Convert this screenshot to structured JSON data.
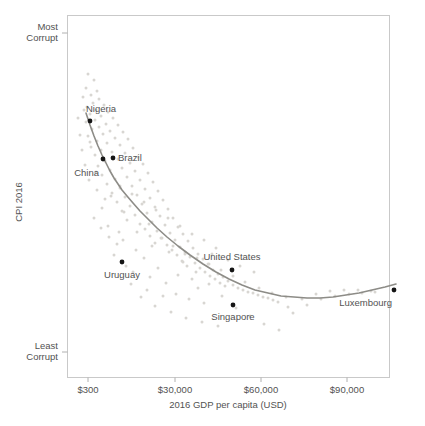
{
  "chart_data": {
    "type": "scatter",
    "title": "",
    "subtitle": "",
    "xlabel": "2016 GDP per capita (USD)",
    "ylabel": "CPI 2016",
    "grid": false,
    "legend": "none",
    "x_scale": "log",
    "x_ticks": [
      {
        "label": "$300",
        "px": 88
      },
      {
        "label": "$30,000",
        "px": 175
      },
      {
        "label": "$60,000",
        "px": 261
      },
      {
        "label": "$90,000",
        "px": 347
      }
    ],
    "y_ticks": [
      {
        "label_line1": "Most",
        "label_line2": "Corrupt",
        "px": 33
      },
      {
        "label_line1": "Least",
        "label_line2": "Corrupt",
        "px": 352
      }
    ],
    "y_axis_direction": "most-corrupt-at-top",
    "highlighted_points": [
      {
        "name": "Nigeria",
        "px": 90,
        "py": 121,
        "label_px": 86,
        "label_py": 112,
        "anchor": "start"
      },
      {
        "name": "China",
        "px": 103,
        "py": 159,
        "label_px": 99,
        "label_py": 176,
        "anchor": "end"
      },
      {
        "name": "Brazil",
        "px": 113,
        "py": 158,
        "label_px": 118,
        "label_py": 161,
        "anchor": "start"
      },
      {
        "name": "Uruguay",
        "px": 122,
        "py": 262,
        "label_px": 122,
        "label_py": 278,
        "anchor": "middle"
      },
      {
        "name": "United States",
        "px": 232,
        "py": 270,
        "label_px": 232,
        "label_py": 260,
        "anchor": "middle"
      },
      {
        "name": "Singapore",
        "px": 233,
        "py": 305,
        "label_px": 233,
        "label_py": 320,
        "anchor": "middle"
      },
      {
        "name": "Luxembourg",
        "px": 394,
        "py": 290,
        "label_px": 392,
        "label_py": 306,
        "anchor": "end"
      }
    ],
    "background_points": [
      [
        88,
        74
      ],
      [
        94,
        80
      ],
      [
        86,
        88
      ],
      [
        97,
        91
      ],
      [
        91,
        95
      ],
      [
        83,
        97
      ],
      [
        99,
        99
      ],
      [
        93,
        103
      ],
      [
        104,
        105
      ],
      [
        87,
        107
      ],
      [
        96,
        110
      ],
      [
        108,
        112
      ],
      [
        90,
        114
      ],
      [
        101,
        116
      ],
      [
        113,
        118
      ],
      [
        95,
        120
      ],
      [
        86,
        122
      ],
      [
        106,
        124
      ],
      [
        118,
        125
      ],
      [
        99,
        127
      ],
      [
        92,
        129
      ],
      [
        110,
        131
      ],
      [
        123,
        132
      ],
      [
        103,
        134
      ],
      [
        88,
        136
      ],
      [
        115,
        138
      ],
      [
        128,
        139
      ],
      [
        97,
        141
      ],
      [
        107,
        143
      ],
      [
        120,
        145
      ],
      [
        91,
        147
      ],
      [
        133,
        148
      ],
      [
        101,
        150
      ],
      [
        112,
        152
      ],
      [
        125,
        153
      ],
      [
        95,
        155
      ],
      [
        138,
        157
      ],
      [
        118,
        159
      ],
      [
        105,
        161
      ],
      [
        130,
        163
      ],
      [
        143,
        164
      ],
      [
        98,
        166
      ],
      [
        122,
        168
      ],
      [
        110,
        170
      ],
      [
        135,
        171
      ],
      [
        148,
        173
      ],
      [
        102,
        175
      ],
      [
        127,
        177
      ],
      [
        115,
        179
      ],
      [
        140,
        180
      ],
      [
        153,
        182
      ],
      [
        107,
        184
      ],
      [
        132,
        186
      ],
      [
        120,
        188
      ],
      [
        145,
        189
      ],
      [
        158,
        191
      ],
      [
        112,
        193
      ],
      [
        137,
        195
      ],
      [
        125,
        197
      ],
      [
        150,
        198
      ],
      [
        163,
        200
      ],
      [
        117,
        202
      ],
      [
        142,
        204
      ],
      [
        130,
        206
      ],
      [
        155,
        207
      ],
      [
        168,
        209
      ],
      [
        122,
        211
      ],
      [
        147,
        213
      ],
      [
        135,
        215
      ],
      [
        160,
        216
      ],
      [
        173,
        218
      ],
      [
        127,
        220
      ],
      [
        152,
        222
      ],
      [
        140,
        224
      ],
      [
        165,
        225
      ],
      [
        178,
        227
      ],
      [
        145,
        229
      ],
      [
        157,
        231
      ],
      [
        170,
        233
      ],
      [
        183,
        234
      ],
      [
        150,
        236
      ],
      [
        162,
        238
      ],
      [
        175,
        240
      ],
      [
        188,
        241
      ],
      [
        155,
        243
      ],
      [
        167,
        245
      ],
      [
        180,
        247
      ],
      [
        193,
        248
      ],
      [
        172,
        250
      ],
      [
        185,
        252
      ],
      [
        198,
        254
      ],
      [
        177,
        255
      ],
      [
        190,
        257
      ],
      [
        203,
        259
      ],
      [
        182,
        261
      ],
      [
        195,
        263
      ],
      [
        208,
        264
      ],
      [
        187,
        266
      ],
      [
        200,
        268
      ],
      [
        213,
        270
      ],
      [
        205,
        272
      ],
      [
        218,
        274
      ],
      [
        210,
        276
      ],
      [
        223,
        277
      ],
      [
        215,
        279
      ],
      [
        228,
        281
      ],
      [
        220,
        283
      ],
      [
        233,
        285
      ],
      [
        225,
        286
      ],
      [
        238,
        288
      ],
      [
        243,
        290
      ],
      [
        248,
        292
      ],
      [
        253,
        293
      ],
      [
        258,
        295
      ],
      [
        263,
        297
      ],
      [
        268,
        298
      ],
      [
        273,
        300
      ],
      [
        278,
        302
      ],
      [
        212,
        254
      ],
      [
        198,
        288
      ],
      [
        176,
        294
      ],
      [
        189,
        299
      ],
      [
        204,
        303
      ],
      [
        166,
        283
      ],
      [
        158,
        268
      ],
      [
        144,
        258
      ],
      [
        150,
        277
      ],
      [
        136,
        250
      ],
      [
        163,
        296
      ],
      [
        131,
        284
      ],
      [
        178,
        275
      ],
      [
        192,
        279
      ],
      [
        141,
        297
      ],
      [
        124,
        212
      ],
      [
        119,
        232
      ],
      [
        109,
        237
      ],
      [
        114,
        255
      ],
      [
        101,
        228
      ],
      [
        94,
        218
      ],
      [
        105,
        199
      ],
      [
        97,
        190
      ],
      [
        89,
        180
      ],
      [
        85,
        165
      ],
      [
        82,
        150
      ],
      [
        80,
        135
      ],
      [
        78,
        118
      ],
      [
        84,
        110
      ],
      [
        90,
        142
      ],
      [
        96,
        172
      ],
      [
        102,
        208
      ],
      [
        108,
        226
      ],
      [
        117,
        244
      ],
      [
        126,
        266
      ],
      [
        133,
        272
      ],
      [
        147,
        290
      ],
      [
        155,
        306
      ],
      [
        171,
        312
      ],
      [
        186,
        318
      ],
      [
        202,
        322
      ],
      [
        218,
        326
      ],
      [
        152,
        246
      ],
      [
        169,
        252
      ],
      [
        183,
        262
      ],
      [
        196,
        272
      ],
      [
        209,
        284
      ],
      [
        222,
        296
      ],
      [
        236,
        308
      ],
      [
        250,
        316
      ],
      [
        264,
        324
      ],
      [
        279,
        330
      ],
      [
        293,
        313
      ],
      [
        307,
        305
      ],
      [
        321,
        299
      ],
      [
        335,
        296
      ],
      [
        349,
        294
      ],
      [
        362,
        293
      ],
      [
        375,
        292
      ],
      [
        288,
        307
      ],
      [
        302,
        299
      ],
      [
        316,
        294
      ],
      [
        330,
        291
      ],
      [
        344,
        290
      ],
      [
        358,
        290
      ],
      [
        371,
        291
      ],
      [
        245,
        282
      ],
      [
        259,
        288
      ],
      [
        272,
        293
      ],
      [
        286,
        297
      ],
      [
        240,
        266
      ],
      [
        254,
        272
      ],
      [
        228,
        260
      ],
      [
        216,
        248
      ],
      [
        204,
        240
      ],
      [
        192,
        234
      ],
      [
        180,
        226
      ],
      [
        168,
        218
      ],
      [
        156,
        210
      ],
      [
        144,
        202
      ],
      [
        132,
        194
      ],
      [
        120,
        186
      ],
      [
        111,
        196
      ],
      [
        123,
        240
      ],
      [
        137,
        232
      ],
      [
        149,
        224
      ],
      [
        161,
        238
      ],
      [
        173,
        246
      ],
      [
        185,
        254
      ],
      [
        197,
        258
      ],
      [
        209,
        264
      ],
      [
        221,
        270
      ],
      [
        233,
        276
      ]
    ],
    "trend_line": [
      [
        86,
        113
      ],
      [
        90,
        125
      ],
      [
        94,
        136
      ],
      [
        98,
        146
      ],
      [
        102,
        155
      ],
      [
        106,
        163
      ],
      [
        110,
        171
      ],
      [
        114,
        178
      ],
      [
        118,
        184
      ],
      [
        122,
        190
      ],
      [
        127,
        196
      ],
      [
        133,
        203
      ],
      [
        140,
        211
      ],
      [
        148,
        219
      ],
      [
        157,
        228
      ],
      [
        167,
        237
      ],
      [
        178,
        246
      ],
      [
        190,
        255
      ],
      [
        203,
        264
      ],
      [
        216,
        272
      ],
      [
        229,
        279
      ],
      [
        242,
        285
      ],
      [
        255,
        290
      ],
      [
        268,
        293
      ],
      [
        281,
        296
      ],
      [
        294,
        297
      ],
      [
        307,
        298
      ],
      [
        320,
        298
      ],
      [
        333,
        297
      ],
      [
        346,
        295
      ],
      [
        359,
        293
      ],
      [
        372,
        290
      ],
      [
        385,
        287
      ],
      [
        396,
        284
      ]
    ]
  },
  "colors": {
    "frame": "#c9c9c9",
    "background_point": "#d8d6d2",
    "highlight_point": "#151515",
    "trend_line": "#8d8c87",
    "text": "#525252",
    "background": "#ffffff"
  }
}
